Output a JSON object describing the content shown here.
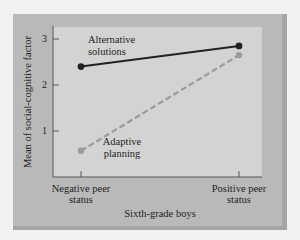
{
  "chart_data": {
    "type": "line",
    "title": "",
    "xlabel": "Sixth-grade boys",
    "ylabel": "Mean of social-cognitive factor",
    "categories": [
      "Negative peer status",
      "Positive peer status"
    ],
    "category_labels": [
      {
        "line1": "Negative peer",
        "line2": "status"
      },
      {
        "line1": "Positive peer",
        "line2": "status"
      }
    ],
    "yticks": [
      "1",
      "2",
      "3"
    ],
    "ylim": [
      0,
      3.2
    ],
    "grid": false,
    "series": [
      {
        "name": "Alternative solutions",
        "label_line1": "Alternative",
        "label_line2": "solutions",
        "values": [
          2.4,
          2.85
        ],
        "color": "#222222",
        "style": "solid"
      },
      {
        "name": "Adaptive planning",
        "label_line1": "Adaptive",
        "label_line2": "planning",
        "values": [
          0.57,
          2.65
        ],
        "color": "#9a9a9a",
        "style": "dashed"
      }
    ]
  },
  "colors": {
    "panel": "#b9b9b9",
    "plot_area": "#d3d3d3",
    "page": "#f2f2f2"
  }
}
